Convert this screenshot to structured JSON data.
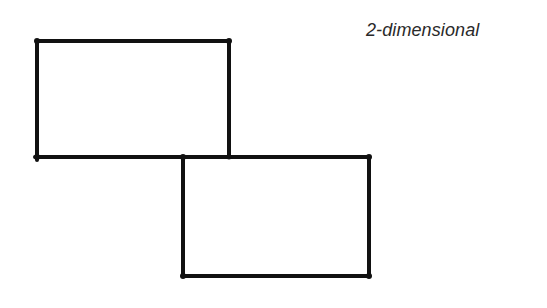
{
  "diagram": {
    "caption": "2-dimensional",
    "stroke_color": "#111111",
    "background": "#ffffff",
    "shapes": [
      {
        "id": "rect-upper-left",
        "type": "rectangle",
        "x1": 37,
        "y1": 41,
        "x2": 229,
        "y2": 157
      },
      {
        "id": "rect-lower-right",
        "type": "rectangle",
        "x1": 183,
        "y1": 157,
        "x2": 369,
        "y2": 276
      }
    ],
    "shared_edge": {
      "x1": 37,
      "y1": 157,
      "x2": 369,
      "y2": 157
    }
  }
}
